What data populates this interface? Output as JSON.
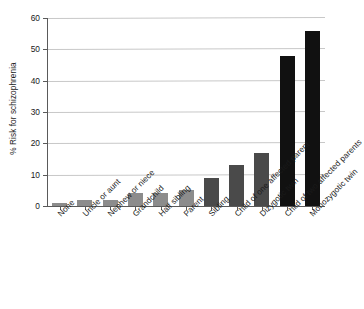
{
  "chart_data": {
    "type": "bar",
    "title": "",
    "xlabel": "",
    "ylabel": "% Risk for schizophrenia",
    "ylim": [
      0,
      60
    ],
    "yticks": [
      0,
      10,
      20,
      30,
      40,
      50,
      60
    ],
    "grid": true,
    "legend": null,
    "categories": [
      "None",
      "Uncle or aunt",
      "Nephew or niece",
      "Grandchild",
      "Half sibling",
      "Parent",
      "Sibling",
      "Child of one affected parent",
      "Dizygotic twin",
      "Child of two affected parents",
      "Monozygotic twin"
    ],
    "values": [
      1,
      2,
      2,
      4,
      4,
      5,
      9,
      13,
      17,
      48,
      56
    ],
    "bar_colors": [
      "#8c8c8c",
      "#8c8c8c",
      "#8c8c8c",
      "#8c8c8c",
      "#8c8c8c",
      "#8c8c8c",
      "#4a4a4a",
      "#4a4a4a",
      "#4a4a4a",
      "#111111",
      "#111111"
    ]
  },
  "axis": {
    "y_title": "% Risk for schizophrenia",
    "tick_labels": [
      "0",
      "10",
      "20",
      "30",
      "40",
      "50",
      "60"
    ]
  },
  "colors": {
    "axis": "#5a5a5a",
    "grid": "#c8c8c8",
    "text": "#1a1a1a",
    "background": "#ffffff"
  }
}
